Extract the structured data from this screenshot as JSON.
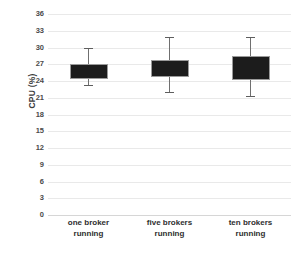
{
  "chart_data": {
    "type": "box",
    "title": "",
    "xlabel": "",
    "ylabel": "CPU (%)",
    "ylim": [
      0,
      36
    ],
    "ytick_step": 3,
    "yticks": [
      36,
      33,
      30,
      27,
      24,
      21,
      18,
      15,
      12,
      9,
      6,
      3,
      0
    ],
    "ytick_labels": [
      "36",
      "33",
      "30",
      "27",
      "24",
      "21",
      "18",
      "15",
      "12",
      "9",
      "6",
      "3",
      "0"
    ],
    "grid": true,
    "legend": "none",
    "categories": [
      "one broker running",
      "five brokers running",
      "ten brokers running"
    ],
    "category_lines": [
      [
        "one broker",
        "running"
      ],
      [
        "five brokers",
        "running"
      ],
      [
        "ten brokers",
        "running"
      ]
    ],
    "series": [
      {
        "name": "CPU usage",
        "boxes": [
          {
            "category": "one broker running",
            "whisker_low": 23.3,
            "box_low": 24.4,
            "box_high": 27.0,
            "whisker_high": 29.9
          },
          {
            "category": "five brokers running",
            "whisker_low": 22.0,
            "box_low": 24.8,
            "box_high": 27.8,
            "whisker_high": 31.9
          },
          {
            "category": "ten brokers running",
            "whisker_low": 21.3,
            "box_low": 24.1,
            "box_high": 28.5,
            "whisker_high": 31.9
          }
        ]
      }
    ],
    "colors": {
      "box_fill": "#1c1c1c",
      "box_border": "#9a9a9a",
      "whisker": "#6f6f6f",
      "gridline": "#e9e9e9",
      "tick_text": "#4a4a4a",
      "label_text": "#2e2e2e",
      "background": "#ffffff"
    }
  }
}
